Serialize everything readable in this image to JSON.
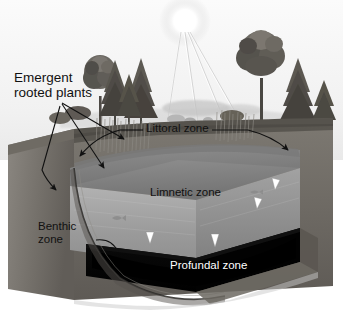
{
  "diagram": {
    "style": "grayscale illustration",
    "colors": {
      "background": "#ffffff",
      "sky": "#f4f4f4",
      "sun": "#ffffff",
      "water_surface": "#8a8a8a",
      "water_column": "#9a9a9a",
      "profundal": "#050505",
      "soil_left": "#6e6a64",
      "soil_front": "#55514c",
      "label_dark": "#111111",
      "label_light": "#ffffff"
    }
  },
  "labels": {
    "emergent": "Emergent\nrooted plants",
    "littoral": "Littoral zone",
    "limnetic": "Limnetic zone",
    "benthic": "Benthic\nzone",
    "profundal": "Profundal zone"
  },
  "elements": {
    "sun": "sun",
    "sun_rays_count": 4,
    "trees": "shoreline trees",
    "reeds": "emergent reeds",
    "block": "cut-away ground block"
  }
}
